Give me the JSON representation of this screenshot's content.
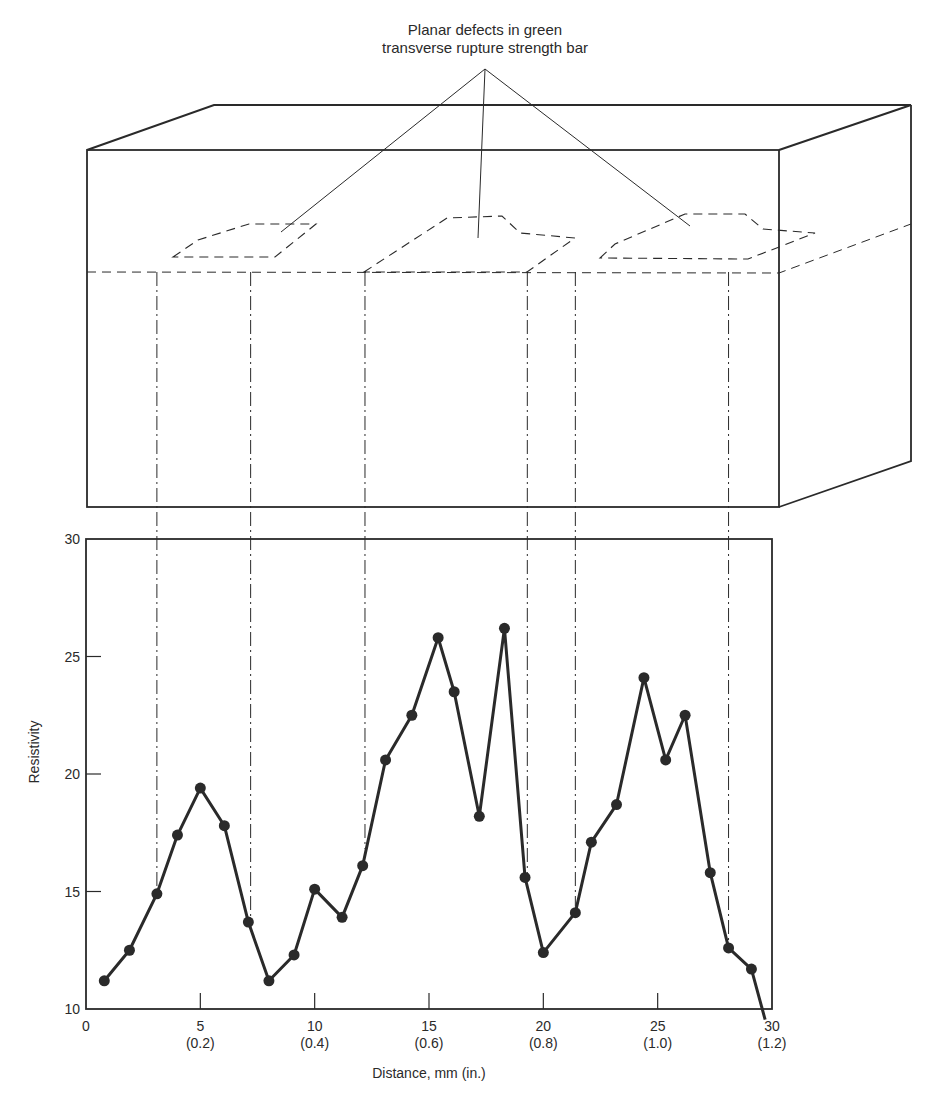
{
  "annotation": {
    "line1": "Planar defects in green",
    "line2": "transverse rupture strength bar"
  },
  "colors": {
    "ink": "#2a2a2a",
    "background": "#ffffff"
  },
  "chart_data": {
    "type": "line",
    "title": "",
    "xlabel": "Distance, mm (in.)",
    "ylabel": "Resistivity",
    "xlim": [
      0,
      30
    ],
    "ylim": [
      10,
      30
    ],
    "grid": false,
    "legend": null,
    "x_ticks": [
      {
        "value": 0,
        "label": "0",
        "sublabel": ""
      },
      {
        "value": 5,
        "label": "5",
        "sublabel": "(0.2)"
      },
      {
        "value": 10,
        "label": "10",
        "sublabel": "(0.4)"
      },
      {
        "value": 15,
        "label": "15",
        "sublabel": "(0.6)"
      },
      {
        "value": 20,
        "label": "20",
        "sublabel": "(0.8)"
      },
      {
        "value": 25,
        "label": "25",
        "sublabel": "(1.0)"
      },
      {
        "value": 30,
        "label": "30",
        "sublabel": "(1.2)"
      }
    ],
    "y_ticks": [
      {
        "value": 10,
        "label": "10"
      },
      {
        "value": 15,
        "label": "15"
      },
      {
        "value": 20,
        "label": "20"
      },
      {
        "value": 25,
        "label": "25"
      },
      {
        "value": 30,
        "label": "30"
      }
    ],
    "series": [
      {
        "name": "Resistivity",
        "marker": "filled-circle",
        "x": [
          0.8,
          1.9,
          3.1,
          4.0,
          5.0,
          6.05,
          7.1,
          8.0,
          9.1,
          10.0,
          11.2,
          12.1,
          13.1,
          14.25,
          15.4,
          16.1,
          17.2,
          18.3,
          19.2,
          20.0,
          21.4,
          22.1,
          23.2,
          24.4,
          25.35,
          26.2,
          27.3,
          28.1,
          29.1
        ],
        "values": [
          11.2,
          12.5,
          14.9,
          17.4,
          19.4,
          17.8,
          13.7,
          11.2,
          12.3,
          15.1,
          13.9,
          16.1,
          20.6,
          22.5,
          25.8,
          23.5,
          18.2,
          26.2,
          15.6,
          12.4,
          14.1,
          17.1,
          18.7,
          24.1,
          20.6,
          22.5,
          15.8,
          12.6,
          11.7
        ]
      }
    ],
    "line_end": {
      "x": 29.7,
      "y": 9.8
    },
    "defect_projection_lines_x": [
      3.1,
      7.2,
      12.2,
      19.3,
      21.4,
      28.1
    ]
  },
  "diagram": {
    "box": {
      "front": {
        "left": 87,
        "top": 150,
        "right": 779,
        "bottom": 507
      },
      "back_offset": {
        "dx": 132,
        "dy": -46
      }
    },
    "defects": [
      {
        "name": "defect-1",
        "points": [
          [
            173,
            257
          ],
          [
            198,
            240
          ],
          [
            249,
            224
          ],
          [
            316,
            224
          ],
          [
            275,
            257
          ]
        ]
      },
      {
        "name": "defect-2",
        "points": [
          [
            364,
            272
          ],
          [
            447,
            218
          ],
          [
            502,
            216
          ],
          [
            520,
            233
          ],
          [
            575,
            238
          ],
          [
            527,
            272
          ]
        ]
      },
      {
        "name": "defect-3",
        "points": [
          [
            600,
            258
          ],
          [
            615,
            244
          ],
          [
            685,
            214
          ],
          [
            745,
            214
          ],
          [
            763,
            229
          ],
          [
            815,
            233
          ],
          [
            748,
            259
          ]
        ]
      }
    ],
    "pointer_apex": [
      485,
      69
    ],
    "pointer_targets": [
      [
        281,
        232
      ],
      [
        478,
        238
      ],
      [
        690,
        226
      ]
    ]
  }
}
